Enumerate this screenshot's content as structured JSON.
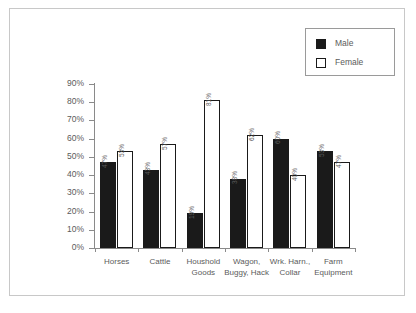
{
  "chart_data": {
    "type": "bar",
    "title": "",
    "subtitle": "",
    "xlabel": "",
    "ylabel": "",
    "ylim": [
      0,
      90
    ],
    "ytick_labels": [
      "90%",
      "80%",
      "70%",
      "60%",
      "50%",
      "40%",
      "30%",
      "20%",
      "10%",
      "0%"
    ],
    "ytick_values": [
      90,
      80,
      70,
      60,
      50,
      40,
      30,
      20,
      10,
      0
    ],
    "grid": false,
    "legend_position": "top-right",
    "categories": [
      "Horses",
      "Cattle",
      "Houshold\nGoods",
      "Wagon,\nBuggy, Hack",
      "Wrk. Harn.,\nCollar",
      "Farm\nEquipment"
    ],
    "series": [
      {
        "name": "Male",
        "color": "#1a1a1a",
        "values": [
          47,
          43,
          19,
          38,
          60,
          53
        ],
        "labels": [
          "47%",
          "43%",
          "19%",
          "38%",
          "60%",
          "53%"
        ]
      },
      {
        "name": "Female",
        "color": "#ffffff",
        "values": [
          53,
          57,
          81,
          62,
          40,
          47
        ],
        "labels": [
          "53%",
          "57%",
          "81%",
          "62%",
          "40%",
          "47%"
        ]
      }
    ]
  },
  "legend": {
    "items": [
      {
        "label": "Male",
        "swatch": "filled-black-square"
      },
      {
        "label": "Female",
        "swatch": "outlined-white-square"
      }
    ]
  },
  "colors": {
    "male_fill": "#1a1a1a",
    "female_fill": "#ffffff",
    "outline": "#1a1a1a",
    "axis": "#8a8a8a",
    "text": "#5b5b5b",
    "frame": "#c8c8c8",
    "background": "#ffffff"
  }
}
